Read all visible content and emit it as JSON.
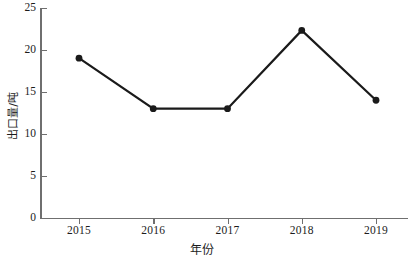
{
  "chart_data": {
    "type": "line",
    "title": "",
    "xlabel": "年份",
    "ylabel": "出口量/吨",
    "categories": [
      "2015",
      "2016",
      "2017",
      "2018",
      "2019"
    ],
    "x": [
      2015,
      2016,
      2017,
      2018,
      2019
    ],
    "values": [
      19,
      13,
      13,
      22.3,
      14
    ],
    "series": [
      {
        "name": "出口量",
        "values": [
          19,
          13,
          13,
          22.3,
          14
        ]
      }
    ],
    "xlim": [
      2014.5,
      2019.6
    ],
    "ylim": [
      0,
      25
    ],
    "yticks": [
      0,
      5,
      10,
      15,
      20,
      25
    ],
    "ytick_labels": [
      "0",
      "5",
      "10",
      "15",
      "20",
      "25"
    ],
    "xticks": [
      2015,
      2016,
      2017,
      2018,
      2019
    ],
    "xtick_labels": [
      "2015",
      "2016",
      "2017",
      "2018",
      "2019"
    ],
    "grid": false,
    "legend": false,
    "legend_position": "none",
    "line_color": "#1a1a1a",
    "marker_color": "#1a1a1a",
    "marker": "circle",
    "axis_color": "#6f6f6f",
    "background_color": "#ffffff",
    "annotations": []
  }
}
